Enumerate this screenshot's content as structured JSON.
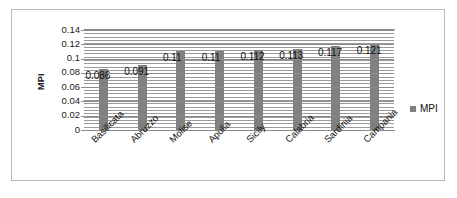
{
  "chart_data": {
    "type": "bar",
    "title": "",
    "xlabel": "",
    "ylabel": "MPI",
    "categories": [
      "Basilicata",
      "Abruzzo",
      "Molise",
      "Apulia",
      "Sicily",
      "Calabria",
      "Sardinia",
      "Campania"
    ],
    "values": [
      0.086,
      0.091,
      0.11,
      0.11,
      0.112,
      0.113,
      0.117,
      0.121
    ],
    "data_labels": [
      "0.086",
      "0.091",
      "0.11",
      "0.11",
      "0.112",
      "0.113",
      "0.117",
      "0.121"
    ],
    "series": [
      {
        "name": "MPI",
        "values": [
          0.086,
          0.091,
          0.11,
          0.11,
          0.112,
          0.113,
          0.117,
          0.121
        ]
      }
    ],
    "ylim": [
      0,
      0.14
    ],
    "y_ticks": [
      0,
      0.02,
      0.04,
      0.06,
      0.08,
      0.1,
      0.12,
      0.14
    ],
    "y_tick_labels": [
      "0",
      "0.02",
      "0.04",
      "0.06",
      "0.08",
      "0.1",
      "0.12",
      "0.14"
    ],
    "grid": "horizontal-minor-dense",
    "legend": {
      "position": "right",
      "entries": [
        "MPI"
      ]
    },
    "bar_color": "#808080",
    "plot_background": "#ffffff"
  },
  "figure": {
    "border_color": "#b9b9b9",
    "background": "#ffffff"
  }
}
